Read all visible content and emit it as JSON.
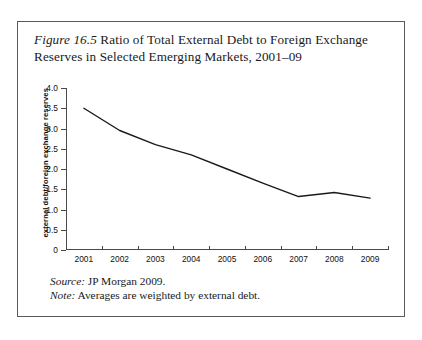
{
  "figure": {
    "label": "Figure 16.5",
    "caption_text": " Ratio of Total External Debt to Foreign Exchange Reserves in Selected Emerging Markets, 2001–09",
    "source_lead": "Source:",
    "source_text": " JP Morgan 2009.",
    "note_lead": "Note:",
    "note_text": " Averages are weighted by external debt."
  },
  "chart_data": {
    "type": "line",
    "title": "Figure 16.5 Ratio of Total External Debt to Foreign Exchange Reserves in Selected Emerging Markets, 2001–09",
    "xlabel": "",
    "ylabel": "external debt/foreign exchange reserves",
    "categories": [
      "2001",
      "2002",
      "2003",
      "2004",
      "2005",
      "2006",
      "2007",
      "2008",
      "2009"
    ],
    "values": [
      3.5,
      2.95,
      2.6,
      2.35,
      2.0,
      1.65,
      1.32,
      1.42,
      1.28
    ],
    "ylim": [
      0,
      4.0
    ],
    "ytick_labels": [
      "4.0",
      "3.5",
      "3.0",
      "2.5",
      "2.0",
      "1.5",
      "1.0",
      "0.5",
      "0"
    ],
    "ytick_values": [
      4.0,
      3.5,
      3.0,
      2.5,
      2.0,
      1.5,
      1.0,
      0.5,
      0
    ],
    "grid": false,
    "legend": "none",
    "line_color": "#1a1a1a",
    "axis_color": "#4a4a4a"
  }
}
